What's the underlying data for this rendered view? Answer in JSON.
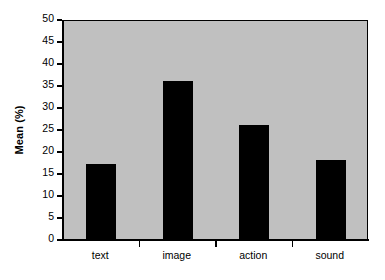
{
  "chart_data": {
    "type": "bar",
    "title": "",
    "subtitle": "",
    "xlabel": "",
    "ylabel": "Mean (%)",
    "categories": [
      "text",
      "image",
      "action",
      "sound"
    ],
    "values": [
      17,
      36,
      26,
      18
    ],
    "series": [
      {
        "name": "Mean (%)",
        "values": [
          17,
          36,
          26,
          18
        ]
      }
    ],
    "ylim": [
      0,
      50
    ],
    "y_ticks": [
      0,
      5,
      10,
      15,
      20,
      25,
      30,
      35,
      40,
      45,
      50
    ],
    "y_tick_labels": [
      "0",
      "5",
      "10",
      "15",
      "20",
      "25",
      "30",
      "35",
      "40",
      "45",
      "50"
    ],
    "grid": false,
    "legend": false,
    "legend_position": "none",
    "annotations": [],
    "colors": {
      "bar_fill": "#000000",
      "plot_background": "#c0c0c0",
      "figure_background": "#ffffff",
      "axis": "#000000",
      "text": "#000000"
    }
  }
}
